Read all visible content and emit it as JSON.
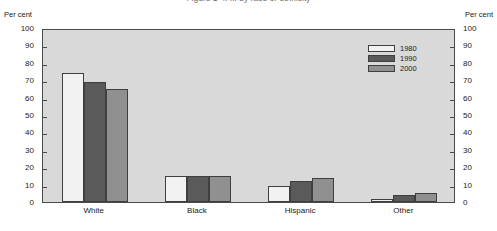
{
  "title": "Figure 1-4. ... by race or ethnicity",
  "axis_caption_left": "Per cent",
  "axis_caption_right": "Per cent",
  "legend": {
    "items": [
      {
        "label": "1980",
        "color": "#f2f2f2"
      },
      {
        "label": "1990",
        "color": "#5a5a5a"
      },
      {
        "label": "2000",
        "color": "#909090"
      }
    ]
  },
  "chart_data": {
    "type": "bar",
    "title": "Figure 1-4. ... by race or ethnicity",
    "xlabel": "",
    "ylabel": "Per cent",
    "ylim": [
      0,
      100
    ],
    "yticks": [
      0,
      10,
      20,
      30,
      40,
      50,
      60,
      70,
      80,
      90,
      100
    ],
    "grid": false,
    "legend_position": "top-right",
    "dual_axis": true,
    "categories": [
      "White",
      "Black",
      "Hispanic",
      "Other"
    ],
    "series": [
      {
        "name": "1980",
        "color": "#f2f2f2",
        "values": [
          74,
          15,
          9,
          2
        ]
      },
      {
        "name": "1990",
        "color": "#5a5a5a",
        "values": [
          69,
          15,
          12,
          4
        ]
      },
      {
        "name": "2000",
        "color": "#909090",
        "values": [
          65,
          15,
          14,
          5
        ]
      }
    ]
  }
}
